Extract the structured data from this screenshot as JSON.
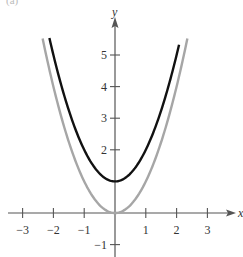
{
  "chart_data": {
    "type": "line",
    "title": "",
    "xlabel": "x",
    "ylabel": "y",
    "xlim": [
      -3.4,
      3.9
    ],
    "ylim": [
      -1.3,
      6.3
    ],
    "grid": false,
    "legend": null,
    "x_ticks": [
      -3,
      -2,
      -1,
      1,
      2,
      3
    ],
    "x_tick_labels": [
      "−3",
      "−2",
      "−1",
      "1",
      "2",
      "3"
    ],
    "y_ticks": [
      -1,
      2,
      3,
      4,
      5
    ],
    "y_tick_labels": [
      "−1",
      "2",
      "3",
      "4",
      "5"
    ],
    "series": [
      {
        "name": "y = x^2 + 1",
        "color": "#111111",
        "width": 2.4,
        "formula": "x^2+1",
        "x_range": [
          -2.13,
          2.08
        ],
        "x": [
          -2.1,
          -1.5,
          -1,
          -0.5,
          0,
          0.5,
          1,
          1.5,
          2.05
        ],
        "values": [
          5.41,
          3.25,
          2,
          1.25,
          1,
          1.25,
          2,
          3.25,
          5.2
        ]
      },
      {
        "name": "y = x^2",
        "color": "#a6a6a6",
        "width": 2.4,
        "formula": "x^2",
        "x_range": [
          -2.35,
          2.35
        ],
        "x": [
          -2.35,
          -2,
          -1.5,
          -1,
          -0.5,
          0,
          0.5,
          1,
          1.5,
          2,
          2.35
        ],
        "values": [
          5.52,
          4,
          2.25,
          1,
          0.25,
          0,
          0.25,
          1,
          2.25,
          4,
          5.52
        ]
      }
    ]
  },
  "page": {
    "corner_fragment": "(a)"
  }
}
